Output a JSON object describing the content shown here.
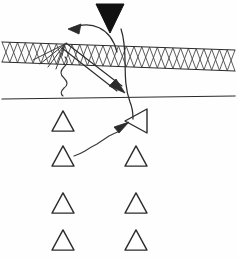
{
  "figure": {
    "canvas": {
      "width": 237,
      "height": 259,
      "background": "#ffffff"
    },
    "ink_color": "#2b2b2b",
    "fill_color": "#111111"
  },
  "elements": {
    "source_wedge": {
      "name": "filled downward wedge",
      "label": "",
      "points": "96,4 124,4 110,33",
      "fill": "#111111"
    },
    "hatched_layer": {
      "name": "cross-hatched band",
      "label": "",
      "top_line": {
        "x1": 2,
        "y1": 42,
        "x2": 235,
        "y2": 50
      },
      "bottom_line": {
        "x1": 2,
        "y1": 62,
        "x2": 235,
        "y2": 71
      },
      "hatch_count": 30,
      "hatch_color": "#4a4a4a"
    },
    "interface_line": {
      "name": "lower horizontal interface",
      "label": "",
      "x1": 2,
      "y1": 99,
      "x2": 235,
      "y2": 96
    },
    "reflected_arc": {
      "name": "curved reflected arrow",
      "label": "",
      "path": "M 117,52 C 110,28 90,20 70,29",
      "head": "70,29 80,25 78,35"
    },
    "transmitted_curve": {
      "name": "long sweeping ray curve",
      "label": "",
      "path": "M 121,29 C 128,52 122,78 130,102 C 133,110 133,114 133,118"
    },
    "hollow_ray": {
      "name": "double-line downgoing ray",
      "label": "",
      "upper": "M 66,44 L 121,87",
      "lower": "M 63,48 L 118,91",
      "head": "124,92 110,85 115,80"
    },
    "fan_rays": {
      "name": "ray fan at reflection point",
      "label": "",
      "origin_x": 65,
      "origin_y": 44,
      "targets": [
        {
          "x": 40,
          "y": 64
        },
        {
          "x": 48,
          "y": 67
        },
        {
          "x": 56,
          "y": 69
        },
        {
          "x": 33,
          "y": 60
        }
      ]
    },
    "squiggle_vertical": {
      "name": "wavy downgoing trace",
      "label": "",
      "path": "M 65,57 q 5,6 -1,11 q -6,6 0,12 q 6,6 0,11 q -5,5 -1,8"
    },
    "squiggle_arrow": {
      "name": "wavy arrow to rotated receiver",
      "label": "",
      "path": "M 74,155 q 7,-3 12,-6 q 6,-4 12,-7 q 7,-4 13,-8 q 6,-3 11,-6",
      "head": "127,122 114,128 119,132"
    }
  },
  "receivers": {
    "name": "triangular receiver symbols",
    "upright": [
      {
        "id": "r1",
        "cx": 63,
        "cy": 121,
        "size": 22,
        "label": ""
      },
      {
        "id": "r2",
        "cx": 63,
        "cy": 156,
        "size": 22,
        "label": ""
      },
      {
        "id": "r3",
        "cx": 136,
        "cy": 156,
        "size": 22,
        "label": ""
      },
      {
        "id": "r4",
        "cx": 63,
        "cy": 203,
        "size": 22,
        "label": ""
      },
      {
        "id": "r5",
        "cx": 136,
        "cy": 203,
        "size": 22,
        "label": ""
      },
      {
        "id": "r6",
        "cx": 63,
        "cy": 240,
        "size": 22,
        "label": ""
      },
      {
        "id": "r7",
        "cx": 136,
        "cy": 240,
        "size": 22,
        "label": ""
      }
    ],
    "rotated": [
      {
        "id": "r8",
        "cx": 136,
        "cy": 121,
        "size": 24,
        "rotation": -90,
        "label": ""
      }
    ]
  }
}
